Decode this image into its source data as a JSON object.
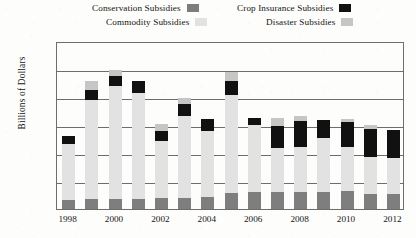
{
  "legend": {
    "entries": [
      {
        "label": "Conservation Subsidies",
        "color": "#7e7e7e",
        "key": "conservation"
      },
      {
        "label": "Commodity Subsidies",
        "color": "#e2e2e2",
        "key": "commodity"
      },
      {
        "label": "Crop Insurance Subsidies",
        "color": "#111111",
        "key": "crop_insurance"
      },
      {
        "label": "Disaster Subsidies",
        "color": "#c6c6c6",
        "key": "disaster"
      }
    ]
  },
  "axes": {
    "y_title": "Billions of Dollars",
    "y_ticks": [
      "$5",
      "$10",
      "$15",
      "$20",
      "$25",
      "$30"
    ],
    "x_ticks": [
      "1998",
      "2000",
      "2002",
      "2004",
      "2006",
      "2008",
      "2010",
      "2012"
    ]
  },
  "chart_data": {
    "type": "bar",
    "title": "",
    "xlabel": "",
    "ylabel": "Billions of Dollars",
    "ylim": [
      0,
      30
    ],
    "ytick_values": [
      5,
      10,
      15,
      20,
      25,
      30
    ],
    "grid": true,
    "stacked": true,
    "legend_position": "top",
    "categories": [
      "1998",
      "1999",
      "2000",
      "2001",
      "2002",
      "2003",
      "2004",
      "2005",
      "2006",
      "2007",
      "2008",
      "2009",
      "2010",
      "2011",
      "2012"
    ],
    "series": [
      {
        "name": "Conservation Subsidies",
        "color": "#7e7e7e",
        "values": [
          1.6,
          1.7,
          1.8,
          1.8,
          1.9,
          2.0,
          2.2,
          2.8,
          3.0,
          3.1,
          3.0,
          3.1,
          3.2,
          2.6,
          2.6
        ]
      },
      {
        "name": "Commodity Subsidies",
        "color": "#e2e2e2",
        "values": [
          10.0,
          17.8,
          20.1,
          19.0,
          10.3,
          14.6,
          11.8,
          17.6,
          12.0,
          7.8,
          8.0,
          9.5,
          7.8,
          6.7,
          6.5
        ]
      },
      {
        "name": "Crop Insurance Subsidies",
        "color": "#111111",
        "values": [
          1.4,
          1.7,
          1.9,
          2.1,
          1.8,
          2.2,
          2.1,
          2.4,
          1.2,
          3.9,
          4.8,
          3.3,
          4.5,
          5.0,
          5.0
        ]
      },
      {
        "name": "Disaster Subsidies",
        "color": "#c6c6c6",
        "values": [
          0.0,
          1.6,
          1.1,
          0.0,
          1.2,
          1.0,
          0.0,
          1.6,
          0.0,
          1.4,
          0.9,
          0.0,
          0.5,
          0.7,
          0.0
        ]
      }
    ]
  }
}
